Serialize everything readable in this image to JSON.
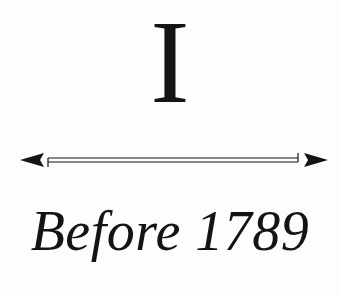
{
  "page": {
    "numeral": "I",
    "subtitle": "Before 1789",
    "arrow": {
      "type": "double-headed-timeline-arrow",
      "color": "#141414"
    },
    "background": "#fdfdfd"
  }
}
